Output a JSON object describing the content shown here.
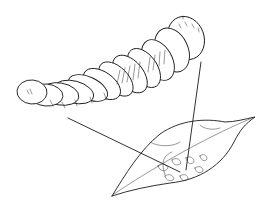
{
  "illustration": {
    "subject": "larva and damaged leaf",
    "elements": [
      "larva",
      "leaf",
      "pointer-line-1",
      "pointer-line-2"
    ],
    "colors": {
      "ink": "#1a1a1a",
      "background": "#ffffff"
    }
  }
}
